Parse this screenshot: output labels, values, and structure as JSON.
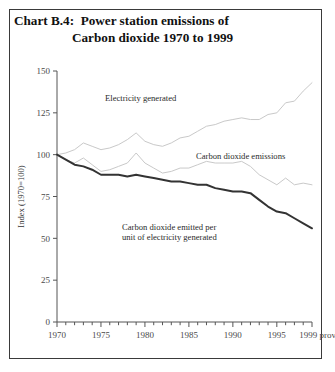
{
  "figure": {
    "frame_border_color": "#3a3a3a",
    "background": "#ffffff",
    "title_label": "Chart B.4:",
    "title_line1": "Power station emissions of",
    "title_line2": "Carbon dioxide 1970 to 1999"
  },
  "annotations": {
    "electricity": "Electricity generated",
    "emissions": "Carbon dioxide emissions",
    "intensity_line1": "Carbon dioxide emitted per",
    "intensity_line2": "unit of electricity generated"
  },
  "chart_data": {
    "type": "line",
    "xlabel": "",
    "ylabel": "Index (1970=100)",
    "xlim": [
      1970,
      1999
    ],
    "ylim": [
      0,
      150
    ],
    "yticks": [
      0,
      25,
      50,
      75,
      100,
      125,
      150
    ],
    "ytick_labels": [
      "0",
      "25",
      "50",
      "75",
      "100",
      "125",
      "150"
    ],
    "xticks": [
      1970,
      1975,
      1980,
      1985,
      1990,
      1995,
      1999
    ],
    "xtick_labels": [
      "1970",
      "1975",
      "1980",
      "1985",
      "1990",
      "1995",
      "1999 prov"
    ],
    "x_minor_ticks_every": 1,
    "grid": false,
    "legend_position": "inline-annotations",
    "x": [
      1970,
      1971,
      1972,
      1973,
      1974,
      1975,
      1976,
      1977,
      1978,
      1979,
      1980,
      1981,
      1982,
      1983,
      1984,
      1985,
      1986,
      1987,
      1988,
      1989,
      1990,
      1991,
      1992,
      1993,
      1994,
      1995,
      1996,
      1997,
      1998,
      1999
    ],
    "series": [
      {
        "name": "Electricity generated",
        "color": "#c9c9c9",
        "width": 1.0,
        "values": [
          100,
          101,
          103,
          107,
          105,
          103,
          104,
          106,
          109,
          113,
          108,
          106,
          105,
          107,
          110,
          111,
          114,
          117,
          118,
          120,
          121,
          122,
          121,
          121,
          124,
          125,
          131,
          132,
          138,
          143
        ]
      },
      {
        "name": "Carbon dioxide emissions",
        "color": "#c9c9c9",
        "width": 1.0,
        "values": [
          100,
          97,
          95,
          98,
          94,
          90,
          91,
          93,
          95,
          101,
          95,
          92,
          89,
          90,
          92,
          92,
          94,
          96,
          95,
          95,
          95,
          96,
          93,
          88,
          85,
          82,
          86,
          82,
          83,
          82
        ]
      },
      {
        "name": "Carbon dioxide emitted per unit of electricity generated",
        "color": "#333333",
        "width": 2.0,
        "values": [
          100,
          97,
          94,
          93,
          91,
          88,
          88,
          88,
          87,
          88,
          87,
          86,
          85,
          84,
          84,
          83,
          82,
          82,
          80,
          79,
          78,
          78,
          77,
          73,
          69,
          66,
          65,
          62,
          59,
          56
        ]
      }
    ]
  }
}
